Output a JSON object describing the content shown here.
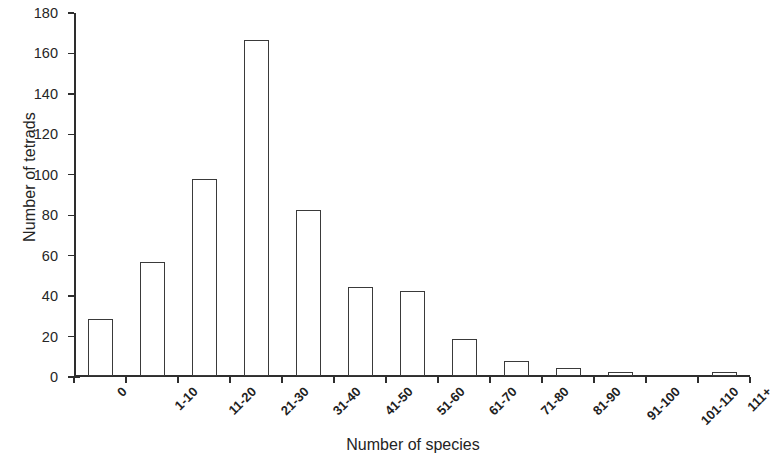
{
  "chart_data": {
    "type": "bar",
    "title": "",
    "xlabel": "Number of species",
    "ylabel": "Number of tetrads",
    "categories": [
      "0",
      "1-10",
      "11-20",
      "21-30",
      "31-40",
      "41-50",
      "51-60",
      "61-70",
      "71-80",
      "81-90",
      "91-100",
      "101-110",
      "111+"
    ],
    "values": [
      28,
      56,
      97,
      166,
      82,
      44,
      42,
      18,
      7,
      4,
      2,
      0,
      2
    ],
    "ylim": [
      0,
      180
    ],
    "ytick_step": 20,
    "yticks": [
      0,
      20,
      40,
      60,
      80,
      100,
      120,
      140,
      160,
      180
    ],
    "ytick_labels": [
      "0",
      "20",
      "40",
      "60",
      "80",
      "100",
      "120",
      "140",
      "160",
      "180"
    ],
    "grid": false,
    "legend": false,
    "bar_fill_color": "#ffffff",
    "bar_edge_color": "#3a3a3a",
    "axis_color": "#2e2e2e",
    "xtick_label_rotation": -45
  }
}
